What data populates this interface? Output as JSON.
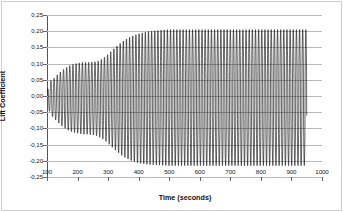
{
  "chart_data": {
    "type": "line",
    "title": "",
    "subtitle": "",
    "xlabel": "Time (seconds)",
    "ylabel": "Lift Coefficient",
    "xlim": [
      100,
      1000
    ],
    "ylim": [
      -0.25,
      0.25
    ],
    "xticks": [
      100,
      200,
      300,
      400,
      500,
      600,
      700,
      800,
      900,
      1000
    ],
    "xtick_labels": [
      "100",
      "200",
      "300",
      "400",
      "500",
      "600",
      "700",
      "800",
      "900",
      "1000"
    ],
    "yticks": [
      0.25,
      0.2,
      0.15,
      0.1,
      0.05,
      0.0,
      -0.05,
      -0.1,
      -0.15,
      -0.2,
      -0.25
    ],
    "ytick_labels": [
      "0,25",
      "0,20",
      "0,15",
      "0,10",
      "0,05",
      "0,00",
      "-0,05",
      "-0,10",
      "-0,15",
      "-0,20",
      "-0,25"
    ],
    "grid": true,
    "grid_axis": "y",
    "legend": false,
    "legend_position": "none",
    "line_color": "#000000",
    "line_width": 0.6,
    "series": [
      {
        "name": "Lift Coefficient",
        "description": "Self-excited vortex-shedding lift oscillation: amplitude grows from near zero at t=100 s, passes a plateau near +0.10/-0.10 around t=230-280 s, then grows to a saturated limit-cycle of about +0.205 / -0.215 by t=500 s and remains steady through t=1000 s.",
        "oscillation_period_seconds": 10.3,
        "mean_value": -0.005,
        "envelope": {
          "t": [
            100,
            110,
            120,
            130,
            140,
            150,
            160,
            170,
            180,
            190,
            200,
            210,
            220,
            230,
            240,
            250,
            260,
            270,
            280,
            290,
            300,
            310,
            320,
            330,
            340,
            350,
            360,
            370,
            380,
            390,
            400,
            420,
            440,
            460,
            480,
            500,
            550,
            600,
            650,
            700,
            750,
            800,
            850,
            900,
            950,
            1000
          ],
          "upper": [
            0.012,
            0.046,
            0.052,
            0.062,
            0.071,
            0.079,
            0.086,
            0.092,
            0.096,
            0.099,
            0.101,
            0.103,
            0.104,
            0.104,
            0.104,
            0.105,
            0.106,
            0.109,
            0.114,
            0.121,
            0.129,
            0.138,
            0.147,
            0.155,
            0.163,
            0.17,
            0.176,
            0.181,
            0.185,
            0.189,
            0.192,
            0.197,
            0.2,
            0.202,
            0.204,
            0.205,
            0.205,
            0.205,
            0.205,
            0.205,
            0.205,
            0.205,
            0.205,
            0.205,
            0.205,
            0.205
          ],
          "lower": [
            -0.012,
            -0.056,
            -0.066,
            -0.076,
            -0.085,
            -0.093,
            -0.1,
            -0.106,
            -0.11,
            -0.113,
            -0.115,
            -0.117,
            -0.118,
            -0.118,
            -0.119,
            -0.12,
            -0.122,
            -0.126,
            -0.131,
            -0.138,
            -0.146,
            -0.155,
            -0.164,
            -0.172,
            -0.18,
            -0.187,
            -0.192,
            -0.197,
            -0.201,
            -0.204,
            -0.207,
            -0.21,
            -0.212,
            -0.213,
            -0.214,
            -0.215,
            -0.215,
            -0.215,
            -0.215,
            -0.215,
            -0.215,
            -0.215,
            -0.215,
            -0.215,
            -0.215
          ]
        }
      }
    ]
  }
}
